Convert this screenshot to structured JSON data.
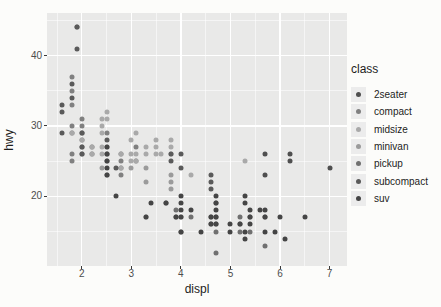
{
  "style": {
    "page_bg": "#fcfcfa",
    "panel_bg": "#e9e9e8",
    "gridline_color": "#ffffff",
    "tick_label_color": "#4d4d4d",
    "axis_title_color": "#1c1c1c",
    "legend_key_bg": "#ececec"
  },
  "chart_data": {
    "type": "scatter",
    "title": "",
    "xlabel": "displ",
    "ylabel": "hwy",
    "legend_title": "class",
    "legend_position": "right",
    "grid": true,
    "x_ticks": [
      2,
      3,
      4,
      5,
      6,
      7
    ],
    "x_minor_ticks": [
      1.5,
      2.5,
      3.5,
      4.5,
      5.5,
      6.5
    ],
    "y_ticks": [
      20,
      30,
      40
    ],
    "y_minor_ticks": [
      15,
      25,
      35,
      45
    ],
    "xlim": [
      1.3,
      7.35
    ],
    "ylim": [
      10.1,
      46.05
    ],
    "classes": [
      {
        "name": "2seater",
        "color": "#4f4f4f"
      },
      {
        "name": "compact",
        "color": "#808080"
      },
      {
        "name": "midsize",
        "color": "#a9a9a9"
      },
      {
        "name": "minivan",
        "color": "#9b9b9b"
      },
      {
        "name": "pickup",
        "color": "#707070"
      },
      {
        "name": "subcompact",
        "color": "#5a5a5a"
      },
      {
        "name": "suv",
        "color": "#454545"
      }
    ],
    "points": [
      [
        5.7,
        26,
        "2seater"
      ],
      [
        5.7,
        23,
        "2seater"
      ],
      [
        6.2,
        26,
        "2seater"
      ],
      [
        6.2,
        25,
        "2seater"
      ],
      [
        7.0,
        24,
        "2seater"
      ],
      [
        1.8,
        25,
        "compact"
      ],
      [
        1.8,
        26,
        "compact"
      ],
      [
        1.8,
        29,
        "compact"
      ],
      [
        1.8,
        30,
        "compact"
      ],
      [
        1.8,
        33,
        "compact"
      ],
      [
        1.8,
        35,
        "compact"
      ],
      [
        1.8,
        37,
        "compact"
      ],
      [
        1.9,
        44,
        "compact"
      ],
      [
        2.0,
        26,
        "compact"
      ],
      [
        2.0,
        27,
        "compact"
      ],
      [
        2.0,
        28,
        "compact"
      ],
      [
        2.0,
        29,
        "compact"
      ],
      [
        2.0,
        30,
        "compact"
      ],
      [
        2.0,
        31,
        "compact"
      ],
      [
        2.2,
        26,
        "compact"
      ],
      [
        2.2,
        27,
        "compact"
      ],
      [
        2.5,
        23,
        "compact"
      ],
      [
        2.5,
        25,
        "compact"
      ],
      [
        2.5,
        26,
        "compact"
      ],
      [
        2.5,
        29,
        "compact"
      ],
      [
        2.8,
        23,
        "compact"
      ],
      [
        2.8,
        24,
        "compact"
      ],
      [
        2.8,
        25,
        "compact"
      ],
      [
        2.8,
        26,
        "compact"
      ],
      [
        3.1,
        25,
        "compact"
      ],
      [
        3.1,
        27,
        "compact"
      ],
      [
        1.8,
        29,
        "midsize"
      ],
      [
        2.0,
        28,
        "midsize"
      ],
      [
        2.0,
        29,
        "midsize"
      ],
      [
        2.2,
        26,
        "midsize"
      ],
      [
        2.2,
        27,
        "midsize"
      ],
      [
        2.4,
        26,
        "midsize"
      ],
      [
        2.4,
        27,
        "midsize"
      ],
      [
        2.4,
        29,
        "midsize"
      ],
      [
        2.4,
        30,
        "midsize"
      ],
      [
        2.4,
        31,
        "midsize"
      ],
      [
        2.5,
        26,
        "midsize"
      ],
      [
        2.5,
        27,
        "midsize"
      ],
      [
        2.5,
        31,
        "midsize"
      ],
      [
        2.5,
        32,
        "midsize"
      ],
      [
        2.8,
        24,
        "midsize"
      ],
      [
        2.8,
        26,
        "midsize"
      ],
      [
        3.0,
        25,
        "midsize"
      ],
      [
        3.0,
        26,
        "midsize"
      ],
      [
        3.0,
        28,
        "midsize"
      ],
      [
        3.1,
        25,
        "midsize"
      ],
      [
        3.1,
        26,
        "midsize"
      ],
      [
        3.1,
        29,
        "midsize"
      ],
      [
        3.3,
        26,
        "midsize"
      ],
      [
        3.3,
        27,
        "midsize"
      ],
      [
        3.5,
        26,
        "midsize"
      ],
      [
        3.5,
        27,
        "midsize"
      ],
      [
        3.5,
        28,
        "midsize"
      ],
      [
        3.6,
        26,
        "midsize"
      ],
      [
        3.8,
        26,
        "midsize"
      ],
      [
        3.8,
        27,
        "midsize"
      ],
      [
        3.8,
        28,
        "midsize"
      ],
      [
        4.2,
        23,
        "midsize"
      ],
      [
        5.3,
        25,
        "midsize"
      ],
      [
        2.4,
        24,
        "minivan"
      ],
      [
        3.0,
        24,
        "minivan"
      ],
      [
        3.3,
        17,
        "minivan"
      ],
      [
        3.3,
        22,
        "minivan"
      ],
      [
        3.3,
        24,
        "minivan"
      ],
      [
        3.8,
        21,
        "minivan"
      ],
      [
        3.8,
        22,
        "minivan"
      ],
      [
        3.8,
        23,
        "minivan"
      ],
      [
        4.0,
        17,
        "minivan"
      ],
      [
        3.7,
        19,
        "pickup"
      ],
      [
        3.9,
        17,
        "pickup"
      ],
      [
        3.9,
        18,
        "pickup"
      ],
      [
        4.0,
        15,
        "pickup"
      ],
      [
        4.2,
        17,
        "pickup"
      ],
      [
        4.6,
        16,
        "pickup"
      ],
      [
        4.6,
        17,
        "pickup"
      ],
      [
        4.7,
        12,
        "pickup"
      ],
      [
        4.7,
        15,
        "pickup"
      ],
      [
        4.7,
        16,
        "pickup"
      ],
      [
        4.7,
        17,
        "pickup"
      ],
      [
        4.7,
        19,
        "pickup"
      ],
      [
        5.2,
        15,
        "pickup"
      ],
      [
        5.2,
        16,
        "pickup"
      ],
      [
        5.2,
        17,
        "pickup"
      ],
      [
        5.4,
        15,
        "pickup"
      ],
      [
        5.4,
        17,
        "pickup"
      ],
      [
        5.7,
        13,
        "pickup"
      ],
      [
        5.7,
        17,
        "pickup"
      ],
      [
        1.6,
        29,
        "subcompact"
      ],
      [
        1.6,
        32,
        "subcompact"
      ],
      [
        1.6,
        33,
        "subcompact"
      ],
      [
        1.8,
        34,
        "subcompact"
      ],
      [
        1.8,
        36,
        "subcompact"
      ],
      [
        1.9,
        41,
        "subcompact"
      ],
      [
        1.9,
        44,
        "subcompact"
      ],
      [
        2.0,
        26,
        "subcompact"
      ],
      [
        2.0,
        27,
        "subcompact"
      ],
      [
        2.0,
        29,
        "subcompact"
      ],
      [
        2.5,
        28,
        "subcompact"
      ],
      [
        2.7,
        24,
        "subcompact"
      ],
      [
        3.8,
        25,
        "subcompact"
      ],
      [
        3.8,
        26,
        "subcompact"
      ],
      [
        4.0,
        24,
        "subcompact"
      ],
      [
        4.0,
        26,
        "subcompact"
      ],
      [
        4.6,
        21,
        "subcompact"
      ],
      [
        4.6,
        22,
        "subcompact"
      ],
      [
        4.6,
        23,
        "subcompact"
      ],
      [
        2.5,
        23,
        "suv"
      ],
      [
        2.5,
        24,
        "suv"
      ],
      [
        2.5,
        25,
        "suv"
      ],
      [
        2.5,
        26,
        "suv"
      ],
      [
        2.5,
        27,
        "suv"
      ],
      [
        2.7,
        20,
        "suv"
      ],
      [
        3.3,
        17,
        "suv"
      ],
      [
        3.4,
        19,
        "suv"
      ],
      [
        3.7,
        19,
        "suv"
      ],
      [
        3.9,
        17,
        "suv"
      ],
      [
        4.0,
        15,
        "suv"
      ],
      [
        4.0,
        17,
        "suv"
      ],
      [
        4.0,
        18,
        "suv"
      ],
      [
        4.0,
        19,
        "suv"
      ],
      [
        4.0,
        20,
        "suv"
      ],
      [
        4.2,
        18,
        "suv"
      ],
      [
        4.4,
        15,
        "suv"
      ],
      [
        4.6,
        16,
        "suv"
      ],
      [
        4.6,
        17,
        "suv"
      ],
      [
        4.7,
        16,
        "suv"
      ],
      [
        4.7,
        17,
        "suv"
      ],
      [
        4.7,
        18,
        "suv"
      ],
      [
        4.7,
        19,
        "suv"
      ],
      [
        4.7,
        20,
        "suv"
      ],
      [
        5.0,
        15,
        "suv"
      ],
      [
        5.0,
        16,
        "suv"
      ],
      [
        5.2,
        16,
        "suv"
      ],
      [
        5.3,
        14,
        "suv"
      ],
      [
        5.3,
        15,
        "suv"
      ],
      [
        5.3,
        19,
        "suv"
      ],
      [
        5.3,
        20,
        "suv"
      ],
      [
        5.4,
        16,
        "suv"
      ],
      [
        5.4,
        17,
        "suv"
      ],
      [
        5.4,
        18,
        "suv"
      ],
      [
        5.6,
        18,
        "suv"
      ],
      [
        5.7,
        15,
        "suv"
      ],
      [
        5.7,
        17,
        "suv"
      ],
      [
        5.7,
        18,
        "suv"
      ],
      [
        5.9,
        15,
        "suv"
      ],
      [
        6.0,
        17,
        "suv"
      ],
      [
        6.1,
        14,
        "suv"
      ],
      [
        6.5,
        17,
        "suv"
      ]
    ]
  }
}
